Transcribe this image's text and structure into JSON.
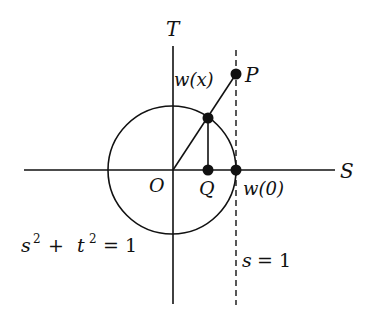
{
  "diagram": {
    "axes": {
      "horizontal_label": "S",
      "vertical_label": "T",
      "origin_label": "O"
    },
    "points": {
      "P": "P",
      "w_x": "w(x)",
      "Q": "Q",
      "w_0": "w(0)"
    },
    "curves": {
      "circle_equation": {
        "s": "s",
        "sup1": "2",
        "plus": "+",
        "t": "t",
        "sup2": "2",
        "eq": "= 1"
      },
      "line_equation": {
        "s": "s",
        "eq": "= 1"
      }
    },
    "colors": {
      "stroke": "#111111",
      "background": "#ffffff"
    }
  }
}
